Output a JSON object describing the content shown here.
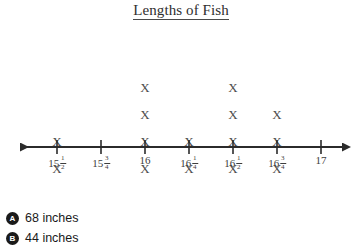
{
  "title": {
    "text": "Lengths of Fish",
    "underlined": true
  },
  "chart_data": {
    "type": "line_plot",
    "title": "Lengths of Fish",
    "xlabel": "",
    "ylabel": "",
    "mark_glyph": "X",
    "categories": [
      "15 1/2",
      "15 3/4",
      "16",
      "16 1/4",
      "16 1/2",
      "16 3/4",
      "17"
    ],
    "values": [
      2,
      0,
      4,
      2,
      4,
      3,
      0
    ],
    "total_marks": 15,
    "axis": {
      "arrow_left": true,
      "arrow_right": true,
      "tick_count": 7,
      "color": "#2b2b2b"
    },
    "tick_labels": [
      {
        "whole": "15",
        "num": "1",
        "den": "2",
        "x": 57
      },
      {
        "whole": "15",
        "num": "3",
        "den": "4",
        "x": 101
      },
      {
        "whole": "16",
        "num": "",
        "den": "",
        "x": 145
      },
      {
        "whole": "16",
        "num": "1",
        "den": "4",
        "x": 189
      },
      {
        "whole": "16",
        "num": "1",
        "den": "2",
        "x": 233
      },
      {
        "whole": "16",
        "num": "3",
        "den": "4",
        "x": 277
      },
      {
        "whole": "17",
        "num": "",
        "den": "",
        "x": 321
      }
    ],
    "grid": false,
    "legend": "none"
  },
  "answers": {
    "choices": [
      {
        "letter": "A",
        "label": "68 inches"
      },
      {
        "letter": "B",
        "label": "44 inches"
      }
    ]
  },
  "colors": {
    "background": "#ffffff",
    "ink": "#3a3a3a",
    "axis": "#2b2b2b",
    "mark": "#4d4d4d",
    "bullet": "#1a1a1a"
  }
}
